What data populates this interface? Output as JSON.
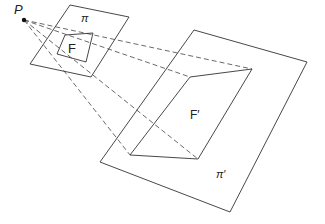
{
  "diagram": {
    "title": "",
    "center_of_projection": {
      "label": "P",
      "point": [
        24,
        20
      ],
      "label_pos": [
        14,
        14
      ]
    },
    "planes": [
      {
        "id": "pi",
        "label": "π",
        "label_pos": [
          81,
          22
        ],
        "corners": [
          [
            70,
            5
          ],
          [
            129,
            17
          ],
          [
            91,
            77
          ],
          [
            30,
            64
          ]
        ]
      },
      {
        "id": "pi-prime",
        "label": "π′",
        "label_pos": [
          216,
          178
        ],
        "corners": [
          [
            194,
            30
          ],
          [
            307,
            62
          ],
          [
            230,
            212
          ],
          [
            100,
            162
          ]
        ]
      }
    ],
    "figures": [
      {
        "id": "F",
        "label": "F",
        "label_pos": [
          68,
          53
        ],
        "corners": [
          [
            65,
            35
          ],
          [
            93,
            33
          ],
          [
            86,
            62
          ],
          [
            57,
            54
          ]
        ]
      },
      {
        "id": "F-prime",
        "label": "F′",
        "label_pos": [
          190,
          119
        ],
        "corners": [
          [
            190,
            77
          ],
          [
            252,
            69
          ],
          [
            198,
            159
          ],
          [
            130,
            155
          ]
        ]
      }
    ],
    "projection_rays": [
      {
        "from": [
          24,
          20
        ],
        "to": [
          190,
          77
        ]
      },
      {
        "from": [
          24,
          20
        ],
        "to": [
          252,
          69
        ]
      },
      {
        "from": [
          24,
          20
        ],
        "to": [
          198,
          159
        ]
      },
      {
        "from": [
          24,
          20
        ],
        "to": [
          130,
          155
        ]
      }
    ]
  }
}
